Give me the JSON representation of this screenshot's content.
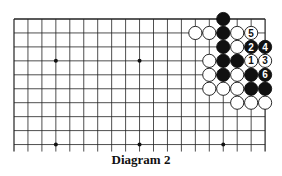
{
  "caption": "Diagram 2",
  "board": {
    "cols": 19,
    "rows_shown": 10,
    "origin_x": 14,
    "origin_y": 19,
    "spacing": 13.95,
    "star_points": [
      [
        3,
        3
      ],
      [
        9,
        3
      ],
      [
        15,
        3
      ],
      [
        3,
        9
      ],
      [
        9,
        9
      ],
      [
        15,
        9
      ]
    ],
    "stones": [
      {
        "c": 15,
        "r": 0,
        "color": "black"
      },
      {
        "c": 13,
        "r": 1,
        "color": "white"
      },
      {
        "c": 14,
        "r": 1,
        "color": "white"
      },
      {
        "c": 15,
        "r": 1,
        "color": "black"
      },
      {
        "c": 16,
        "r": 1,
        "color": "white"
      },
      {
        "c": 17,
        "r": 1,
        "color": "white",
        "label": "5"
      },
      {
        "c": 15,
        "r": 2,
        "color": "black"
      },
      {
        "c": 16,
        "r": 2,
        "color": "white"
      },
      {
        "c": 17,
        "r": 2,
        "color": "black",
        "label": "2"
      },
      {
        "c": 18,
        "r": 2,
        "color": "black",
        "label": "4"
      },
      {
        "c": 14,
        "r": 3,
        "color": "white"
      },
      {
        "c": 15,
        "r": 3,
        "color": "black"
      },
      {
        "c": 16,
        "r": 3,
        "color": "black"
      },
      {
        "c": 17,
        "r": 3,
        "color": "white",
        "label": "1"
      },
      {
        "c": 18,
        "r": 3,
        "color": "white",
        "label": "3"
      },
      {
        "c": 14,
        "r": 4,
        "color": "white"
      },
      {
        "c": 15,
        "r": 4,
        "color": "black"
      },
      {
        "c": 16,
        "r": 4,
        "color": "white"
      },
      {
        "c": 17,
        "r": 4,
        "color": "black"
      },
      {
        "c": 18,
        "r": 4,
        "color": "black",
        "label": "6"
      },
      {
        "c": 14,
        "r": 5,
        "color": "white"
      },
      {
        "c": 15,
        "r": 5,
        "color": "white"
      },
      {
        "c": 16,
        "r": 5,
        "color": "white"
      },
      {
        "c": 17,
        "r": 5,
        "color": "black"
      },
      {
        "c": 18,
        "r": 5,
        "color": "black"
      },
      {
        "c": 16,
        "r": 6,
        "color": "white"
      },
      {
        "c": 17,
        "r": 6,
        "color": "white"
      },
      {
        "c": 18,
        "r": 6,
        "color": "white"
      }
    ]
  }
}
